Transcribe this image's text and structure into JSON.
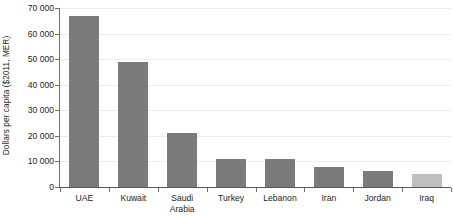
{
  "chart_data": {
    "type": "bar",
    "title": "",
    "xlabel": "",
    "ylabel": "Dollars per capita ($2011, MER)",
    "categories": [
      "UAE",
      "Kuwait",
      "Saudi Arabia",
      "Turkey",
      "Lebanon",
      "Iran",
      "Jordan",
      "Iraq"
    ],
    "values": [
      67000,
      48800,
      21000,
      11000,
      10800,
      7800,
      6400,
      5200
    ],
    "ylim": [
      0,
      70000
    ],
    "ytick_labels": [
      "0",
      "10 000",
      "20 000",
      "30 000",
      "40 000",
      "50 000",
      "60 000",
      "70 000"
    ],
    "ytick_values": [
      0,
      10000,
      20000,
      30000,
      40000,
      50000,
      60000,
      70000
    ],
    "grid": true,
    "legend": "none",
    "bar_colors": [
      "#7b7b7b",
      "#7b7b7b",
      "#7b7b7b",
      "#7b7b7b",
      "#7b7b7b",
      "#7b7b7b",
      "#7b7b7b",
      "#bfbfbf"
    ],
    "colors": {
      "bar_default": "#7b7b7b",
      "bar_highlight": "#bfbfbf",
      "gridline": "#ededed",
      "axis": "#6d6e71",
      "text": "#231f20",
      "background": "#ffffff"
    }
  }
}
